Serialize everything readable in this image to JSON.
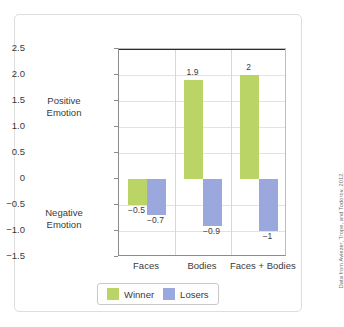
{
  "figure": {
    "positive_region_label": "Positive\nEmotion",
    "negative_region_label": "Negative\nEmotion",
    "credit": "Data from Aviezer, Trope, and Todorov, 2012."
  },
  "legend": {
    "items": [
      {
        "label": "Winner",
        "color": "#bad465"
      },
      {
        "label": "Losers",
        "color": "#9aa8dd"
      }
    ]
  },
  "axis": {
    "yticks": [
      "2.5",
      "2.0",
      "1.5",
      "1.0",
      "0.5",
      "0",
      "−0.5",
      "−1.0",
      "−1.5"
    ]
  },
  "chart_data": {
    "type": "bar",
    "title": "",
    "xlabel": "",
    "ylabel": "",
    "ylim": [
      -1.5,
      2.5
    ],
    "ytick_step": 0.5,
    "grid": true,
    "legend_position": "bottom",
    "categories": [
      "Faces",
      "Bodies",
      "Faces + Bodies"
    ],
    "series": [
      {
        "name": "Winner",
        "color": "#bad465",
        "values": [
          -0.5,
          1.9,
          2
        ],
        "labels": [
          "−0.5",
          "1.9",
          "2"
        ]
      },
      {
        "name": "Losers",
        "color": "#9aa8dd",
        "values": [
          -0.7,
          -0.9,
          -1
        ],
        "labels": [
          "−0.7",
          "−0.9",
          "−1"
        ]
      }
    ]
  }
}
